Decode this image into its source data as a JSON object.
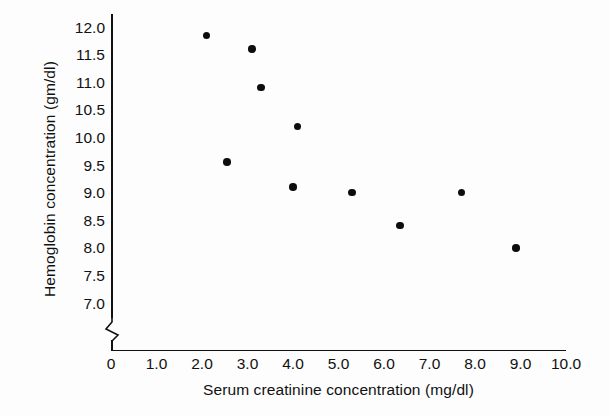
{
  "figure": {
    "background_color": "#fdfdfd",
    "ink_color": "#111111",
    "marker_color": "#0d0d0d"
  },
  "edge_fragments": {
    "note": "partial letters from adjacent text column cropped at left image edge",
    "glyphs": [
      "-",
      ",",
      "t",
      ",",
      "r",
      "-",
      "-",
      "·",
      "e",
      "a",
      "v",
      ")"
    ]
  },
  "chart_data": {
    "type": "scatter",
    "title": "",
    "xlabel": "Serum creatinine concentration (mg/dl)",
    "ylabel": "Hemoglobin concentration (gm/dl)",
    "xlim": [
      0,
      10
    ],
    "ylim": [
      7.0,
      12.0
    ],
    "grid": false,
    "legend": null,
    "y_axis_break": true,
    "y_axis_break_below": 7.0,
    "xticks": [
      0,
      1.0,
      2.0,
      3.0,
      4.0,
      5.0,
      6.0,
      7.0,
      8.0,
      9.0,
      10.0
    ],
    "xtick_labels": [
      "0",
      "1.0",
      "2.0",
      "3.0",
      "4.0",
      "5.0",
      "6.0",
      "7.0",
      "8.0",
      "9.0",
      "10.0"
    ],
    "yticks": [
      7.0,
      7.5,
      8.0,
      8.5,
      9.0,
      9.5,
      10.0,
      10.5,
      11.0,
      11.5,
      12.0
    ],
    "ytick_labels": [
      "7.0",
      "7.5",
      "8.0",
      "8.5",
      "9.0",
      "9.5",
      "10.0",
      "10.5",
      "11.0",
      "11.5",
      "12.0"
    ],
    "series": [
      {
        "name": "patients",
        "marker": "filled-circle",
        "points": [
          {
            "x": 2.1,
            "y": 11.85
          },
          {
            "x": 3.1,
            "y": 11.6
          },
          {
            "x": 3.3,
            "y": 10.9
          },
          {
            "x": 4.1,
            "y": 10.2
          },
          {
            "x": 2.55,
            "y": 9.55
          },
          {
            "x": 4.0,
            "y": 9.1
          },
          {
            "x": 5.3,
            "y": 9.0
          },
          {
            "x": 6.35,
            "y": 8.4
          },
          {
            "x": 7.7,
            "y": 9.0
          },
          {
            "x": 8.9,
            "y": 8.0
          }
        ]
      }
    ]
  }
}
